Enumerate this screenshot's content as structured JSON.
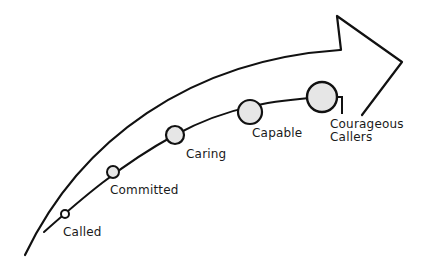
{
  "diagram": {
    "type": "progression-arrow",
    "stages": [
      {
        "label": "Called",
        "x": 65,
        "y": 214,
        "r": 4,
        "label_x": 62,
        "label_y": 225
      },
      {
        "label": "Committed",
        "x": 113,
        "y": 172,
        "r": 6,
        "label_x": 110,
        "label_y": 183
      },
      {
        "label": "Caring",
        "x": 175,
        "y": 135,
        "r": 9,
        "label_x": 185,
        "label_y": 146
      },
      {
        "label": "Capable",
        "x": 250,
        "y": 112,
        "r": 12,
        "label_x": 252,
        "label_y": 126
      },
      {
        "label": "Courageous",
        "label2": "Callers",
        "x": 322,
        "y": 97,
        "r": 15,
        "label_x": 330,
        "label_y": 117
      }
    ],
    "colors": {
      "stroke": "#111111",
      "node_fill": "#e6e6e6",
      "background": "#ffffff"
    }
  }
}
